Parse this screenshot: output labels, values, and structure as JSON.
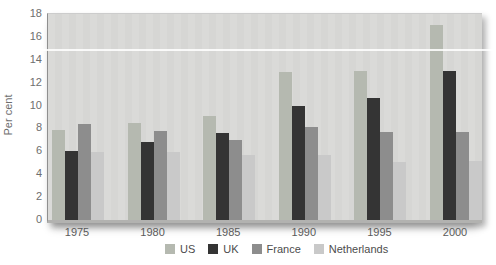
{
  "figure": {
    "background": "#ffffff",
    "panel_background": "#d9d9d7",
    "axis_line_color": "#8f8f8f",
    "tick_label_color": "#6e6e6e",
    "year_label_color": "#5a5a5a",
    "legend_text_color": "#4c4c4c",
    "scan_artifact": "white horizontal line across image at value 15"
  },
  "chart_data": {
    "type": "bar",
    "title": "",
    "xlabel": "",
    "ylabel": "Per cent",
    "ylim": [
      0,
      18
    ],
    "yticks": [
      0,
      2,
      4,
      6,
      8,
      10,
      12,
      14,
      16,
      18
    ],
    "grid": false,
    "legend_position": "bottom",
    "categories": [
      "1975",
      "1980",
      "1985",
      "1990",
      "1995",
      "2000"
    ],
    "series": [
      {
        "name": "US",
        "color": "#b5b9b0",
        "values": [
          7.9,
          8.5,
          9.1,
          12.9,
          13.0,
          17.0
        ]
      },
      {
        "name": "UK",
        "color": "#343434",
        "values": [
          6.0,
          6.8,
          7.6,
          10.0,
          10.7,
          13.0
        ]
      },
      {
        "name": "France",
        "color": "#8d8d8d",
        "values": [
          8.4,
          7.8,
          7.0,
          8.1,
          7.7,
          7.7
        ]
      },
      {
        "name": "Netherlands",
        "color": "#c9c9c9",
        "values": [
          5.9,
          5.9,
          5.7,
          5.7,
          5.1,
          5.2
        ]
      }
    ]
  }
}
